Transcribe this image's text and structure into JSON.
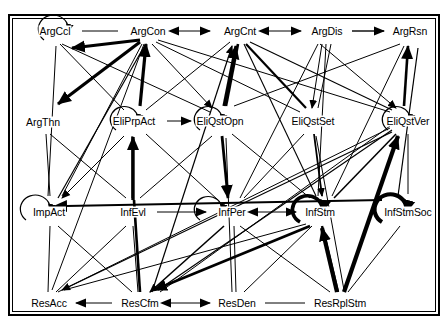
{
  "figure": {
    "type": "directed-graph",
    "title": "",
    "background": "#ffffff",
    "frame_color": "#000000",
    "edge_color": "#000000",
    "label_color": "#000000"
  },
  "nodes": [
    {
      "id": "ArgCcl",
      "label": "ArgCcl",
      "x": 55,
      "y": 31,
      "row": 1,
      "self_loop": true,
      "loop_side": "left",
      "loop_weight": "thin"
    },
    {
      "id": "ArgCon",
      "label": "ArgCon",
      "x": 148,
      "y": 31,
      "row": 1,
      "self_loop": false
    },
    {
      "id": "ArgCnt",
      "label": "ArgCnt",
      "x": 240,
      "y": 31,
      "row": 1,
      "self_loop": false
    },
    {
      "id": "ArgDis",
      "label": "ArgDis",
      "x": 327,
      "y": 31,
      "row": 1,
      "self_loop": false
    },
    {
      "id": "ArgRsn",
      "label": "ArgRsn",
      "x": 410,
      "y": 31,
      "row": 1,
      "self_loop": false
    },
    {
      "id": "ArgThn",
      "label": "ArgThn",
      "x": 43,
      "y": 122,
      "row": 2,
      "self_loop": false
    },
    {
      "id": "EliPrpAct",
      "label": "EliPrpAct",
      "x": 134,
      "y": 121,
      "row": 2,
      "self_loop": true,
      "loop_side": "left",
      "loop_weight": "thin"
    },
    {
      "id": "EliQstOpn",
      "label": "EliQstOpn",
      "x": 220,
      "y": 121,
      "row": 2,
      "self_loop": true,
      "loop_side": "left",
      "loop_weight": "thin"
    },
    {
      "id": "EliQstSet",
      "label": "EliQstSet",
      "x": 313,
      "y": 121,
      "row": 2,
      "self_loop": false
    },
    {
      "id": "EliQstVer",
      "label": "EliQstVer",
      "x": 408,
      "y": 121,
      "row": 2,
      "self_loop": true,
      "loop_side": "left",
      "loop_weight": "thin"
    },
    {
      "id": "ImpAct",
      "label": "ImpAct",
      "x": 49,
      "y": 212,
      "row": 3,
      "self_loop": true,
      "loop_side": "left",
      "loop_weight": "thin"
    },
    {
      "id": "InfEvl",
      "label": "InfEvl",
      "x": 133,
      "y": 212,
      "row": 3,
      "self_loop": false
    },
    {
      "id": "InfPer",
      "label": "InfPer",
      "x": 232,
      "y": 212,
      "row": 3,
      "self_loop": true,
      "loop_side": "left",
      "loop_weight": "thin"
    },
    {
      "id": "InfStm",
      "label": "InfStm",
      "x": 320,
      "y": 212,
      "row": 3,
      "self_loop": true,
      "loop_side": "left",
      "loop_weight": "thick"
    },
    {
      "id": "InfStmSoc",
      "label": "InfStmSoc",
      "x": 408,
      "y": 212,
      "row": 3,
      "self_loop": true,
      "loop_side": "left",
      "loop_weight": "thick"
    },
    {
      "id": "ResAcc",
      "label": "ResAcc",
      "x": 49,
      "y": 303,
      "row": 4,
      "self_loop": false
    },
    {
      "id": "ResCfm",
      "label": "ResCfm",
      "x": 140,
      "y": 303,
      "row": 4,
      "self_loop": false
    },
    {
      "id": "ResDen",
      "label": "ResDen",
      "x": 237,
      "y": 303,
      "row": 4,
      "self_loop": false
    },
    {
      "id": "ResRplStm",
      "label": "ResRplStm",
      "x": 340,
      "y": 303,
      "row": 4,
      "self_loop": false
    }
  ],
  "edges": [
    {
      "from": "ArgCcl",
      "to": "ArgCon",
      "weight": "thin",
      "arrow": "none"
    },
    {
      "from": "ArgCnt",
      "to": "ArgCon",
      "weight": "thin",
      "arrow": "both"
    },
    {
      "from": "ArgDis",
      "to": "ArgCnt",
      "weight": "thin",
      "arrow": "both"
    },
    {
      "from": "ArgDis",
      "to": "ArgRsn",
      "weight": "medium",
      "arrow": "end"
    },
    {
      "from": "ArgCon",
      "to": "ArgCcl",
      "weight": "thick",
      "arrow": "end"
    },
    {
      "from": "EliPrpAct",
      "to": "EliQstOpn",
      "weight": "thin",
      "arrow": "end"
    },
    {
      "from": "EliPrpAct",
      "to": "ArgCon",
      "weight": "thick",
      "arrow": "end"
    },
    {
      "from": "EliQstOpn",
      "to": "ArgCnt",
      "weight": "thick",
      "arrow": "end"
    },
    {
      "from": "ArgThn",
      "to": "ArgCcl",
      "weight": "thick",
      "arrow": "end"
    },
    {
      "from": "InfEvl",
      "to": "InfPer",
      "weight": "thin",
      "arrow": "end"
    },
    {
      "from": "InfPer",
      "to": "InfStm",
      "weight": "thin",
      "arrow": "both"
    },
    {
      "from": "InfEvl",
      "to": "EliPrpAct",
      "weight": "thick",
      "arrow": "end"
    },
    {
      "from": "ResAcc",
      "to": "ResCfm",
      "weight": "thin",
      "arrow": "start"
    },
    {
      "from": "ResCfm",
      "to": "ResDen",
      "weight": "thin",
      "arrow": "both"
    },
    {
      "from": "ResDen",
      "to": "ResRplStm",
      "weight": "thin",
      "arrow": "none"
    },
    {
      "from": "ResRplStm",
      "to": "InfStm",
      "weight": "thick",
      "arrow": "end"
    },
    {
      "from": "ResRplStm",
      "to": "EliQstVer",
      "weight": "thick",
      "arrow": "end"
    },
    {
      "from": "ResCfm",
      "to": "ArgCnt",
      "weight": "thick",
      "arrow": "end"
    },
    {
      "from": "ResCfm",
      "to": "EliQstOpn",
      "weight": "thick",
      "arrow": "end"
    },
    {
      "from": "ImpAct",
      "to": "ArgCon",
      "weight": "thick",
      "arrow": "end"
    },
    {
      "from": "EliQstVer",
      "to": "ArgRsn",
      "weight": "thick",
      "arrow": "end"
    },
    {
      "from": "EliQstSet",
      "to": "ArgDis",
      "weight": "thin",
      "arrow": "end"
    },
    {
      "from": "EliQstVer",
      "to": "ArgDis",
      "weight": "thin",
      "arrow": "end"
    }
  ]
}
